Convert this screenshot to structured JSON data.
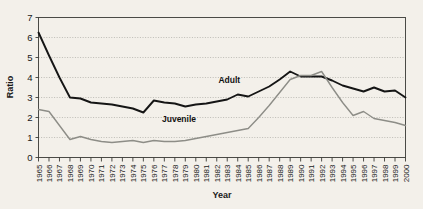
{
  "chart_data": {
    "type": "line",
    "title": "",
    "xlabel": "Year",
    "ylabel": "Ratio",
    "grid": true,
    "legend_position": "inline-annotation",
    "xlim": [
      1965,
      2000
    ],
    "ylim": [
      0,
      7
    ],
    "ytick_step": 1,
    "yticks": [
      0,
      1,
      2,
      3,
      4,
      5,
      6,
      7
    ],
    "categories": [
      "1965",
      "1966",
      "1967",
      "1968",
      "1969",
      "1970",
      "1971",
      "1972",
      "1973",
      "1974",
      "1975",
      "1976",
      "1977",
      "1978",
      "1979",
      "1980",
      "1981",
      "1982",
      "1983",
      "1984",
      "1985",
      "1986",
      "1987",
      "1988",
      "1989",
      "1990",
      "1991",
      "1992",
      "1993",
      "1994",
      "1995",
      "1996",
      "1997",
      "1998",
      "1999",
      "2000"
    ],
    "series": [
      {
        "name": "Adult",
        "color": "#151515",
        "label_x": 1983.2,
        "label_y": 3.75,
        "values": [
          6.25,
          5.1,
          4.0,
          3.0,
          2.95,
          2.75,
          2.7,
          2.65,
          2.55,
          2.45,
          2.25,
          2.85,
          2.75,
          2.7,
          2.55,
          2.65,
          2.7,
          2.8,
          2.9,
          3.15,
          3.05,
          3.3,
          3.55,
          3.9,
          4.3,
          4.05,
          4.05,
          4.05,
          3.85,
          3.6,
          3.45,
          3.3,
          3.5,
          3.3,
          3.35,
          3.0
        ]
      },
      {
        "name": "Juvenile",
        "color": "#8d8d87",
        "label_x": 1978.4,
        "label_y": 1.8,
        "values": [
          2.4,
          2.3,
          1.6,
          0.9,
          1.05,
          0.9,
          0.8,
          0.75,
          0.8,
          0.85,
          0.75,
          0.85,
          0.8,
          0.8,
          0.85,
          0.95,
          1.05,
          1.15,
          1.25,
          1.35,
          1.45,
          2.0,
          2.6,
          3.25,
          3.9,
          4.1,
          4.1,
          4.3,
          3.5,
          2.75,
          2.1,
          2.3,
          1.95,
          1.85,
          1.75,
          1.6
        ]
      }
    ]
  }
}
